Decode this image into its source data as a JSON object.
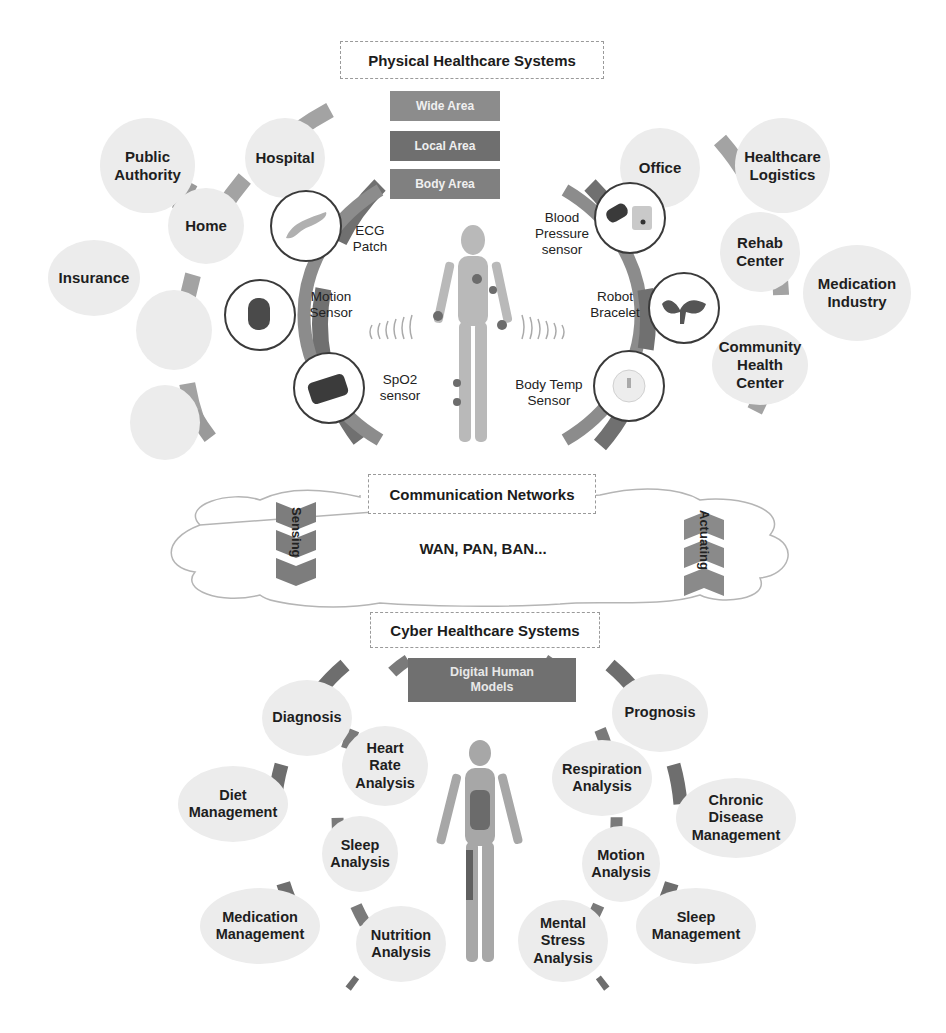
{
  "physical": {
    "title": "Physical Healthcare Systems",
    "areas": [
      "Wide Area",
      "Local Area",
      "Body Area"
    ],
    "area_colors": [
      "#8c8c8c",
      "#6f6f6f",
      "#808080"
    ],
    "outer_left": [
      "Public Authority",
      "Insurance",
      "",
      ""
    ],
    "inner_left": [
      "Hospital",
      "Home",
      ""
    ],
    "outer_right": [
      "Healthcare Logistics",
      "Medication Industry"
    ],
    "inner_right": [
      "Office",
      "Rehab Center",
      "Community Health Center"
    ],
    "sensors_left": [
      {
        "label": "ECG Patch",
        "icon": "ecg-patch-icon"
      },
      {
        "label": "Motion Sensor",
        "icon": "motion-sensor-icon"
      },
      {
        "label": "SpO2 sensor",
        "icon": "spo2-sensor-icon"
      }
    ],
    "sensors_right": [
      {
        "label": "Blood Pressure sensor",
        "icon": "blood-pressure-icon"
      },
      {
        "label": "Robot Bracelet",
        "icon": "robot-bracelet-icon"
      },
      {
        "label": "Body Temp Sensor",
        "icon": "body-temp-icon"
      }
    ]
  },
  "network": {
    "title": "Communication Networks",
    "subtitle": "WAN, PAN, BAN...",
    "left_arrow": "Sensing",
    "right_arrow": "Actuating"
  },
  "cyber": {
    "title": "Cyber Healthcare Systems",
    "core": "Digital Human Models",
    "outer_left": [
      "Diagnosis",
      "Diet Management",
      "Medication Management"
    ],
    "inner_left": [
      "Heart Rate Analysis",
      "Sleep Analysis",
      "Nutrition Analysis"
    ],
    "inner_right": [
      "Respiration Analysis",
      "Motion Analysis",
      "Mental Stress Analysis"
    ],
    "outer_right": [
      "Prognosis",
      "Chronic Disease Management",
      "Sleep Management"
    ]
  },
  "colors": {
    "arc_dark": "#6e6e6e",
    "arc_mid": "#8f8f8f",
    "arc_light": "#a8a8a8",
    "bubble": "#ececec"
  }
}
